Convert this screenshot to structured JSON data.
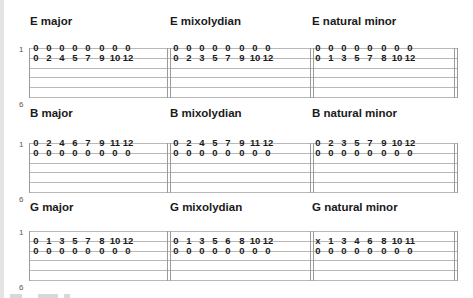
{
  "rows": [
    {
      "string_label_top": "1",
      "string_label_bottom": "6",
      "scales": [
        {
          "title": "E major",
          "strings": {
            "1": [
              "0",
              "0",
              "0",
              "0",
              "0",
              "0",
              "0",
              "0"
            ],
            "2": [
              "0",
              "2",
              "4",
              "5",
              "7",
              "9",
              "10",
              "12"
            ]
          }
        },
        {
          "title": "E mixolydian",
          "strings": {
            "1": [
              "0",
              "0",
              "0",
              "0",
              "0",
              "0",
              "0",
              "0"
            ],
            "2": [
              "0",
              "2",
              "3",
              "5",
              "7",
              "9",
              "10",
              "12"
            ]
          }
        },
        {
          "title": "E natural minor",
          "strings": {
            "1": [
              "0",
              "0",
              "0",
              "0",
              "0",
              "0",
              "0",
              "0"
            ],
            "2": [
              "0",
              "1",
              "3",
              "5",
              "7",
              "8",
              "10",
              "12"
            ]
          }
        }
      ]
    },
    {
      "string_label_top": "1",
      "string_label_bottom": "6",
      "scales": [
        {
          "title": "B major",
          "strings": {
            "1": [
              "0",
              "2",
              "4",
              "6",
              "7",
              "9",
              "11",
              "12"
            ],
            "2": [
              "0",
              "0",
              "0",
              "0",
              "0",
              "0",
              "0",
              "0"
            ]
          }
        },
        {
          "title": "B mixolydian",
          "strings": {
            "1": [
              "0",
              "2",
              "4",
              "5",
              "7",
              "9",
              "11",
              "12"
            ],
            "2": [
              "0",
              "0",
              "0",
              "0",
              "0",
              "0",
              "0",
              "0"
            ]
          }
        },
        {
          "title": "B natural minor",
          "strings": {
            "1": [
              "0",
              "2",
              "3",
              "5",
              "7",
              "9",
              "10",
              "12"
            ],
            "2": [
              "0",
              "0",
              "0",
              "0",
              "0",
              "0",
              "0",
              "0"
            ]
          }
        }
      ]
    },
    {
      "string_label_top": "1",
      "string_label_bottom": "6",
      "scales": [
        {
          "title": "G major",
          "strings": {
            "2": [
              "0",
              "1",
              "3",
              "5",
              "7",
              "8",
              "10",
              "12"
            ],
            "3": [
              "0",
              "0",
              "0",
              "0",
              "0",
              "0",
              "0",
              "0"
            ]
          }
        },
        {
          "title": "G mixolydian",
          "strings": {
            "2": [
              "0",
              "1",
              "3",
              "5",
              "6",
              "8",
              "10",
              "12"
            ],
            "3": [
              "0",
              "0",
              "0",
              "0",
              "0",
              "0",
              "0",
              "0"
            ]
          }
        },
        {
          "title": "G natural minor",
          "strings": {
            "2": [
              "x",
              "1",
              "3",
              "4",
              "6",
              "8",
              "10",
              "11"
            ],
            "3": [
              "0",
              "0",
              "0",
              "0",
              "0",
              "0",
              "0",
              "0"
            ]
          }
        }
      ]
    }
  ]
}
